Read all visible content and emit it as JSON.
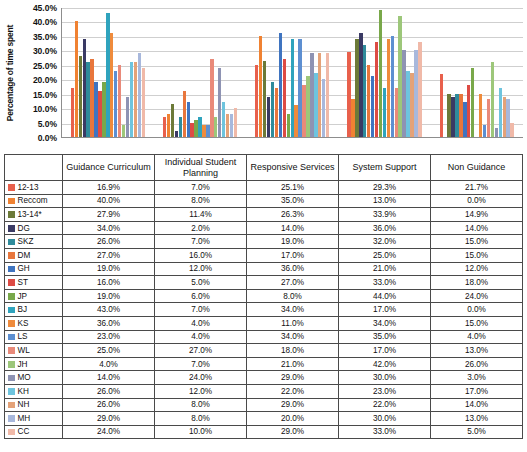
{
  "chart_data": {
    "type": "bar",
    "title": "",
    "xlabel": "",
    "ylabel": "Percentage of time spent",
    "ylim": [
      0,
      45
    ],
    "ytick_labels": [
      "0.0%",
      "5.0%",
      "10.0%",
      "15.0%",
      "20.0%",
      "25.0%",
      "30.0%",
      "35.0%",
      "40.0%",
      "45.0%"
    ],
    "ytick_values": [
      0,
      5,
      10,
      15,
      20,
      25,
      30,
      35,
      40,
      45
    ],
    "grid": true,
    "legend_position": "table-row-labels",
    "categories": [
      "Guidance Curriculum",
      "Individual Student Planning",
      "Responsive Services",
      "System Support",
      "Non Guidance"
    ],
    "series": [
      {
        "name": "12-13",
        "color": "#e8604c",
        "values": [
          16.9,
          7.0,
          25.1,
          29.3,
          21.7
        ]
      },
      {
        "name": "Reccom",
        "color": "#f08232",
        "values": [
          40.0,
          8.0,
          35.0,
          13.0,
          0.0
        ]
      },
      {
        "name": "13-14*",
        "color": "#6c7a38",
        "values": [
          27.9,
          11.4,
          26.3,
          33.9,
          14.9
        ]
      },
      {
        "name": "DG",
        "color": "#3a3a64",
        "values": [
          34.0,
          2.0,
          14.0,
          36.0,
          14.0
        ]
      },
      {
        "name": "SKZ",
        "color": "#2f8b9b",
        "values": [
          26.0,
          7.0,
          19.0,
          32.0,
          15.0
        ]
      },
      {
        "name": "DM",
        "color": "#e8763c",
        "values": [
          27.0,
          16.0,
          17.0,
          25.0,
          15.0
        ]
      },
      {
        "name": "GH",
        "color": "#3f74c0",
        "values": [
          19.0,
          12.0,
          36.0,
          21.0,
          12.0
        ]
      },
      {
        "name": "ST",
        "color": "#dd4b44",
        "values": [
          16.0,
          5.0,
          27.0,
          33.0,
          18.0
        ]
      },
      {
        "name": "JP",
        "color": "#79a84a",
        "values": [
          19.0,
          6.0,
          8.0,
          44.0,
          24.0
        ]
      },
      {
        "name": "BJ",
        "color": "#2fa3bd",
        "values": [
          43.0,
          7.0,
          34.0,
          17.0,
          0.0
        ]
      },
      {
        "name": "KS",
        "color": "#ef8b3c",
        "values": [
          36.0,
          4.0,
          11.0,
          34.0,
          15.0
        ]
      },
      {
        "name": "LS",
        "color": "#5d8fd1",
        "values": [
          23.0,
          4.0,
          34.0,
          35.0,
          4.0
        ]
      },
      {
        "name": "WL",
        "color": "#e98a7a",
        "values": [
          25.0,
          27.0,
          18.0,
          17.0,
          13.0
        ]
      },
      {
        "name": "JH",
        "color": "#9dc77a",
        "values": [
          4.0,
          7.0,
          21.0,
          42.0,
          26.0
        ]
      },
      {
        "name": "MO",
        "color": "#8e93b3",
        "values": [
          14.0,
          24.0,
          29.0,
          30.0,
          3.0
        ]
      },
      {
        "name": "KH",
        "color": "#6ec4de",
        "values": [
          26.0,
          12.0,
          22.0,
          23.0,
          17.0
        ]
      },
      {
        "name": "NH",
        "color": "#e4a278",
        "values": [
          26.0,
          8.0,
          29.0,
          22.0,
          14.0
        ]
      },
      {
        "name": "MH",
        "color": "#a8b8dc",
        "values": [
          29.0,
          8.0,
          20.0,
          30.0,
          13.0
        ]
      },
      {
        "name": "CC",
        "color": "#f0b9a8",
        "values": [
          24.0,
          10.0,
          29.0,
          33.0,
          5.0
        ]
      }
    ]
  },
  "table": {
    "headers": [
      "",
      "Guidance Curriculum",
      "Individual Student Planning",
      "Responsive Services",
      "System Support",
      "Non Guidance"
    ],
    "rows": [
      {
        "label": "12-13",
        "color": "#e8604c",
        "cells": [
          "16.9%",
          "7.0%",
          "25.1%",
          "29.3%",
          "21.7%"
        ]
      },
      {
        "label": "Reccom",
        "color": "#f08232",
        "cells": [
          "40.0%",
          "8.0%",
          "35.0%",
          "13.0%",
          "0.0%"
        ]
      },
      {
        "label": "13-14*",
        "color": "#6c7a38",
        "cells": [
          "27.9%",
          "11.4%",
          "26.3%",
          "33.9%",
          "14.9%"
        ]
      },
      {
        "label": "DG",
        "color": "#3a3a64",
        "cells": [
          "34.0%",
          "2.0%",
          "14.0%",
          "36.0%",
          "14.0%"
        ]
      },
      {
        "label": "SKZ",
        "color": "#2f8b9b",
        "cells": [
          "26.0%",
          "7.0%",
          "19.0%",
          "32.0%",
          "15.0%"
        ]
      },
      {
        "label": "DM",
        "color": "#e8763c",
        "cells": [
          "27.0%",
          "16.0%",
          "17.0%",
          "25.0%",
          "15.0%"
        ]
      },
      {
        "label": "GH",
        "color": "#3f74c0",
        "cells": [
          "19.0%",
          "12.0%",
          "36.0%",
          "21.0%",
          "12.0%"
        ]
      },
      {
        "label": "ST",
        "color": "#dd4b44",
        "cells": [
          "16.0%",
          "5.0%",
          "27.0%",
          "33.0%",
          "18.0%"
        ]
      },
      {
        "label": "JP",
        "color": "#79a84a",
        "cells": [
          "19.0%",
          "6.0%",
          "8.0%",
          "44.0%",
          "24.0%"
        ]
      },
      {
        "label": "BJ",
        "color": "#2fa3bd",
        "cells": [
          "43.0%",
          "7.0%",
          "34.0%",
          "17.0%",
          "0.0%"
        ]
      },
      {
        "label": "KS",
        "color": "#ef8b3c",
        "cells": [
          "36.0%",
          "4.0%",
          "11.0%",
          "34.0%",
          "15.0%"
        ]
      },
      {
        "label": "LS",
        "color": "#5d8fd1",
        "cells": [
          "23.0%",
          "4.0%",
          "34.0%",
          "35.0%",
          "4.0%"
        ]
      },
      {
        "label": "WL",
        "color": "#e98a7a",
        "cells": [
          "25.0%",
          "27.0%",
          "18.0%",
          "17.0%",
          "13.0%"
        ]
      },
      {
        "label": "JH",
        "color": "#9dc77a",
        "cells": [
          "4.0%",
          "7.0%",
          "21.0%",
          "42.0%",
          "26.0%"
        ]
      },
      {
        "label": "MO",
        "color": "#8e93b3",
        "cells": [
          "14.0%",
          "24.0%",
          "29.0%",
          "30.0%",
          "3.0%"
        ]
      },
      {
        "label": "KH",
        "color": "#6ec4de",
        "cells": [
          "26.0%",
          "12.0%",
          "22.0%",
          "23.0%",
          "17.0%"
        ]
      },
      {
        "label": "NH",
        "color": "#e4a278",
        "cells": [
          "26.0%",
          "8.0%",
          "29.0%",
          "22.0%",
          "14.0%"
        ]
      },
      {
        "label": "MH",
        "color": "#a8b8dc",
        "cells": [
          "29.0%",
          "8.0%",
          "20.0%",
          "30.0%",
          "13.0%"
        ]
      },
      {
        "label": "CC",
        "color": "#f0b9a8",
        "cells": [
          "24.0%",
          "10.0%",
          "29.0%",
          "33.0%",
          "5.0%"
        ]
      }
    ]
  }
}
